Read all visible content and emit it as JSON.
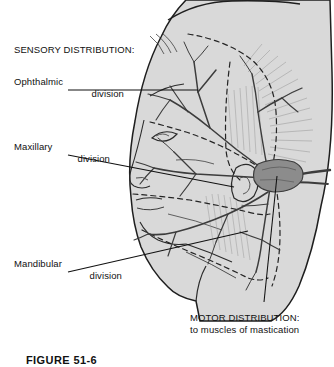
{
  "figure": {
    "title_caption": "FIGURE 51-6",
    "background_color": "#ffffff"
  },
  "colors": {
    "head_fill": "#d9d9d9",
    "head_fill_light": "#e3e3e3",
    "outline": "#1e1e1e",
    "nerve": "#4a4a4a",
    "ganglion": "#8a8a8a",
    "dashed_boundary": "#2a2a2a",
    "hatch": "#9a9a9a",
    "leader": "#111111",
    "text": "#111111"
  },
  "labels": {
    "sensory_heading": "SENSORY DISTRIBUTION:",
    "ophthalmic": "Ophthalmic\ndivision",
    "ophthalmic_line1": "Ophthalmic",
    "ophthalmic_line2": "division",
    "maxillary_line1": "Maxillary",
    "maxillary_line2": "division",
    "mandibular_line1": "Mandibular",
    "mandibular_line2": "division",
    "motor_line1": "MOTOR DISTRIBUTION:",
    "motor_line2": "to muscles of mastication"
  },
  "leaders": [
    {
      "name": "ophthalmic-leader",
      "from": [
        68,
        90
      ],
      "to": [
        196,
        90
      ]
    },
    {
      "name": "maxillary-leader",
      "from": [
        68,
        155
      ],
      "to": [
        232,
        186
      ]
    },
    {
      "name": "mandibular-leader",
      "from": [
        68,
        272
      ],
      "to": [
        246,
        232
      ]
    },
    {
      "name": "motor-leader",
      "from": [
        264,
        300
      ],
      "to": [
        276,
        178
      ]
    }
  ],
  "regions": [
    {
      "name": "ophthalmic-territory",
      "label": "Ophthalmic division",
      "position": "upper-forehead-and-eye"
    },
    {
      "name": "maxillary-territory",
      "label": "Maxillary division",
      "position": "mid-face-cheek"
    },
    {
      "name": "mandibular-territory",
      "label": "Mandibular division",
      "position": "lower-jaw"
    },
    {
      "name": "motor-territory",
      "label": "Motor distribution to muscles of mastication",
      "position": "temporal-masseter"
    }
  ],
  "anatomy": {
    "ganglion_label": "trigeminal-ganglion",
    "orientation": "left-lateral-profile-facing-left"
  }
}
